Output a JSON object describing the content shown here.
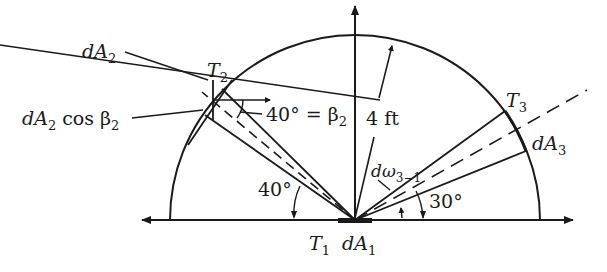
{
  "diagram": {
    "labels": {
      "dA2": "dA",
      "dA2_sub": "2",
      "T2": "T",
      "T2_sub": "2",
      "dA2cos": "dA",
      "dA2cos_sub": "2",
      "dA2cos_rest": " cos β",
      "dA2cos_rest_sub": "2",
      "angle_eq": "40° = β",
      "angle_eq_sub": "2",
      "radius": "4 ft",
      "T3": "T",
      "T3_sub": "3",
      "dA3": "dA",
      "dA3_sub": "3",
      "domega": "dω",
      "domega_sub": "3−1",
      "angle_30": "30°",
      "angle_40": "40°",
      "T1": "T",
      "T1_sub": "1",
      "dA1": "dA",
      "dA1_sub": "1"
    },
    "geometry": {
      "radius_ft": 4,
      "angle_T2_deg": 40,
      "angle_T3_deg": 30,
      "beta2_deg": 40
    },
    "colors": {
      "line": "#1a1a1a",
      "background": "#ffffff"
    }
  }
}
